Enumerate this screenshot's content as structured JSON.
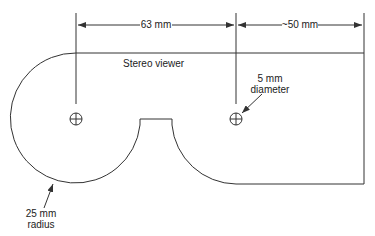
{
  "title": "Stereo viewer",
  "dimensions": {
    "eye_spacing": "63 mm",
    "extension": "~50 mm"
  },
  "annotations": {
    "hole_size_line1": "5 mm",
    "hole_size_line2": "diameter",
    "radius_line1": "25 mm",
    "radius_line2": "radius"
  },
  "colors": {
    "line": "#333333",
    "background": "#ffffff"
  }
}
